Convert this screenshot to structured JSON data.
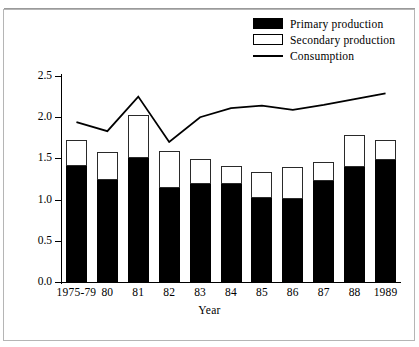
{
  "chart_data": {
    "type": "bar",
    "title": "",
    "xlabel": "Year",
    "ylabel": "Millions of tons",
    "categories": [
      "1975-79",
      "80",
      "81",
      "82",
      "83",
      "84",
      "85",
      "86",
      "87",
      "88",
      "1989"
    ],
    "ylim": [
      0.0,
      2.5
    ],
    "ytick_labels": [
      "0.0",
      "0.5",
      "1.0",
      "1.5",
      "2.0",
      "2.5"
    ],
    "ytick_values": [
      0.0,
      0.5,
      1.0,
      1.5,
      2.0,
      2.5
    ],
    "grid": false,
    "legend_position": "top-right",
    "stacked": true,
    "series": [
      {
        "name": "Primary production",
        "type": "bar",
        "color": "#000000",
        "values": [
          1.41,
          1.24,
          1.5,
          1.14,
          1.19,
          1.19,
          1.02,
          1.01,
          1.22,
          1.4,
          1.48
        ]
      },
      {
        "name": "Secondary production",
        "type": "bar",
        "color": "#ffffff",
        "values": [
          0.31,
          0.34,
          0.53,
          0.45,
          0.3,
          0.22,
          0.31,
          0.39,
          0.24,
          0.38,
          0.24
        ]
      },
      {
        "name": "Consumption",
        "type": "line",
        "color": "#000000",
        "values": [
          1.94,
          1.83,
          2.25,
          1.7,
          2.0,
          2.11,
          2.14,
          2.09,
          2.15,
          2.22,
          2.29
        ]
      }
    ],
    "bar_totals": [
      1.72,
      1.58,
      2.03,
      1.59,
      1.49,
      1.41,
      1.33,
      1.4,
      1.46,
      1.78,
      1.72
    ]
  },
  "legend": {
    "items": [
      {
        "label": "Primary production",
        "swatch": "solid-black-rectangle"
      },
      {
        "label": "Secondary production",
        "swatch": "hollow-white-rectangle"
      },
      {
        "label": "Consumption",
        "swatch": "solid-line"
      }
    ]
  },
  "axes": {
    "x_title": "Year",
    "y_title": "Millions of tons"
  }
}
